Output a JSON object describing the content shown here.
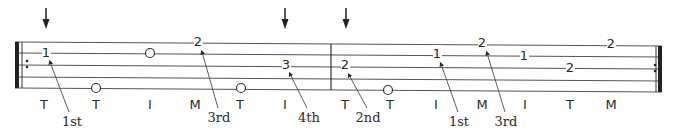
{
  "tablature": {
    "strings": 5,
    "staff": {
      "x_start": 15,
      "x_end": 662,
      "lines_y_left": [
        42,
        53,
        65,
        77,
        88
      ],
      "lines_y_right": [
        46,
        57,
        69,
        81,
        92
      ],
      "barline_x": 331
    },
    "repeat_start": {
      "x": 15,
      "dots_y": [
        61,
        67
      ]
    },
    "repeat_end": {
      "x": 655,
      "dots_y": [
        65,
        71
      ]
    },
    "strum_arrows": [
      {
        "x": 46,
        "label": "down-arrow"
      },
      {
        "x": 285,
        "label": "down-arrow"
      },
      {
        "x": 346,
        "label": "down-arrow"
      }
    ],
    "notes": [
      {
        "x": 46,
        "y": 57,
        "text": "1"
      },
      {
        "x": 96,
        "y": 92,
        "text": "O"
      },
      {
        "x": 150,
        "y": 57,
        "text": "O"
      },
      {
        "x": 198,
        "y": 46,
        "text": "2"
      },
      {
        "x": 241,
        "y": 92,
        "text": "O"
      },
      {
        "x": 286,
        "y": 69,
        "text": "3"
      },
      {
        "x": 345,
        "y": 69,
        "text": "2"
      },
      {
        "x": 388,
        "y": 94,
        "text": "O"
      },
      {
        "x": 437,
        "y": 58,
        "text": "1"
      },
      {
        "x": 482,
        "y": 47,
        "text": "2"
      },
      {
        "x": 524,
        "y": 60,
        "text": "1"
      },
      {
        "x": 570,
        "y": 72,
        "text": "2"
      },
      {
        "x": 611,
        "y": 48,
        "text": "2"
      }
    ],
    "fingering": [
      {
        "x": 44,
        "text": "T"
      },
      {
        "x": 96,
        "text": "T"
      },
      {
        "x": 150,
        "text": "I"
      },
      {
        "x": 195,
        "text": "M"
      },
      {
        "x": 240,
        "text": "T"
      },
      {
        "x": 285,
        "text": "I"
      },
      {
        "x": 345,
        "text": "T"
      },
      {
        "x": 390,
        "text": "T"
      },
      {
        "x": 436,
        "text": "I"
      },
      {
        "x": 482,
        "text": "M"
      },
      {
        "x": 525,
        "text": "I"
      },
      {
        "x": 570,
        "text": "T"
      },
      {
        "x": 611,
        "text": "M"
      }
    ],
    "pointer_labels": [
      {
        "text": "1st",
        "label_x": 72,
        "label_y": 126,
        "from_x": 69,
        "from_y": 112,
        "to_x": 50,
        "to_y": 62
      },
      {
        "text": "3rd",
        "label_x": 219,
        "label_y": 122,
        "from_x": 218,
        "from_y": 108,
        "to_x": 202,
        "to_y": 52
      },
      {
        "text": "4th",
        "label_x": 309,
        "label_y": 122,
        "from_x": 307,
        "from_y": 108,
        "to_x": 290,
        "to_y": 74
      },
      {
        "text": "2nd",
        "label_x": 368,
        "label_y": 122,
        "from_x": 367,
        "from_y": 108,
        "to_x": 349,
        "to_y": 75
      },
      {
        "text": "1st",
        "label_x": 459,
        "label_y": 126,
        "from_x": 458,
        "from_y": 112,
        "to_x": 441,
        "to_y": 64
      },
      {
        "text": "3rd",
        "label_x": 506,
        "label_y": 126,
        "from_x": 505,
        "from_y": 112,
        "to_x": 487,
        "to_y": 53
      }
    ]
  }
}
